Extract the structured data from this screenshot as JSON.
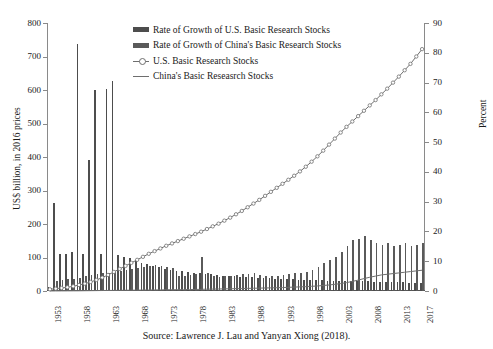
{
  "figure": {
    "source_note": "Source: Lawrence J. Lau and Yanyan Xiong (2018)."
  },
  "legend": {
    "items": [
      {
        "label": "Rate of Growth of U.S. Basic Research Stocks",
        "marker": "bar-swatch",
        "color": "#4d4d4d"
      },
      {
        "label": "Rate of Growth of China's Basic Research Stocks",
        "marker": "bar-swatch",
        "color": "#5a5a5a"
      },
      {
        "label": "U.S. Basic Research Stocks",
        "marker": "line-open-circle",
        "color": "#6e6e6e"
      },
      {
        "label": "China's Basic Reseasrch Stocks",
        "marker": "line-plain",
        "color": "#6e6e6e"
      }
    ]
  },
  "chart_data": {
    "type": "bar",
    "title": "",
    "xlabel": "",
    "ylabel": "US$ billion, in 2016 prices",
    "y2label": "Percent",
    "ylim": [
      0,
      800
    ],
    "y2lim": [
      0,
      90
    ],
    "yticks": [
      0,
      100,
      200,
      300,
      400,
      500,
      600,
      700,
      800
    ],
    "y2ticks": [
      0,
      10,
      20,
      30,
      40,
      50,
      60,
      70,
      80,
      90
    ],
    "grid": false,
    "legend_position": "upper-center",
    "x": [
      1953,
      1954,
      1955,
      1956,
      1957,
      1958,
      1959,
      1960,
      1961,
      1962,
      1963,
      1964,
      1965,
      1966,
      1967,
      1968,
      1969,
      1970,
      1971,
      1972,
      1973,
      1974,
      1975,
      1976,
      1977,
      1978,
      1979,
      1980,
      1981,
      1982,
      1983,
      1984,
      1985,
      1986,
      1987,
      1988,
      1989,
      1990,
      1991,
      1992,
      1993,
      1994,
      1995,
      1996,
      1997,
      1998,
      1999,
      2000,
      2001,
      2002,
      2003,
      2004,
      2005,
      2006,
      2007,
      2008,
      2009,
      2010,
      2011,
      2012,
      2013,
      2014,
      2015,
      2016,
      2017
    ],
    "xtick_labels": [
      1953,
      1958,
      1963,
      1968,
      1973,
      1978,
      1983,
      1988,
      1993,
      1998,
      2003,
      2008,
      2013,
      2017
    ],
    "series": [
      {
        "name": "Rate of Growth of U.S. Basic Research Stocks",
        "axis": "right",
        "kind": "bar",
        "unit": "percent",
        "values": [
          1.5,
          29.5,
          12.5,
          12.5,
          13.0,
          83.0,
          12.5,
          44.0,
          67.5,
          12.5,
          68.0,
          70.5,
          12.0,
          11.5,
          11.0,
          10.5,
          9.5,
          9.0,
          8.5,
          8.0,
          7.5,
          7.0,
          6.8,
          6.6,
          6.4,
          6.2,
          6.0,
          5.8,
          5.6,
          5.4,
          5.2,
          5.0,
          4.9,
          4.8,
          4.7,
          4.6,
          4.5,
          4.4,
          4.3,
          4.2,
          4.1,
          4.0,
          3.9,
          3.8,
          3.8,
          3.7,
          3.6,
          3.6,
          3.5,
          3.5,
          3.4,
          3.4,
          3.3,
          3.3,
          3.2,
          3.2,
          3.1,
          3.1,
          3.0,
          3.0,
          2.9,
          2.9,
          2.8,
          2.8,
          2.7
        ]
      },
      {
        "name": "Rate of Growth of China's Basic Research Stocks",
        "axis": "right",
        "kind": "bar",
        "unit": "percent",
        "values": [
          1.0,
          3.5,
          3.8,
          4.0,
          4.2,
          4.5,
          5.0,
          5.5,
          5.8,
          6.0,
          6.2,
          6.5,
          6.8,
          7.2,
          7.5,
          7.8,
          8.2,
          8.4,
          8.6,
          8.3,
          8.0,
          7.6,
          5.0,
          5.2,
          5.4,
          5.6,
          11.5,
          6.0,
          5.0,
          4.8,
          5.0,
          5.2,
          5.4,
          5.6,
          5.8,
          6.0,
          5.5,
          5.2,
          5.0,
          5.2,
          5.5,
          5.8,
          6.0,
          6.2,
          6.5,
          7.0,
          8.0,
          9.5,
          10.5,
          11.5,
          13.0,
          15.0,
          17.0,
          17.5,
          18.5,
          17.0,
          16.0,
          15.5,
          16.0,
          15.0,
          15.5,
          16.0,
          15.0,
          15.5,
          16.0
        ]
      },
      {
        "name": "U.S. Basic Research Stocks",
        "axis": "left",
        "kind": "line-marker",
        "unit": "US$ billion",
        "values": [
          5,
          7,
          9,
          11,
          14,
          18,
          22,
          27,
          33,
          40,
          48,
          57,
          66,
          75,
          84,
          93,
          102,
          111,
          119,
          127,
          135,
          142,
          149,
          156,
          163,
          170,
          177,
          185,
          193,
          201,
          210,
          219,
          229,
          239,
          250,
          261,
          272,
          284,
          296,
          308,
          320,
          332,
          344,
          357,
          371,
          386,
          402,
          419,
          437,
          455,
          473,
          490,
          506,
          522,
          538,
          554,
          570,
          587,
          604,
          622,
          640,
          659,
          678,
          700,
          722
        ]
      },
      {
        "name": "China's Basic Reseasrch Stocks",
        "axis": "left",
        "kind": "line",
        "unit": "US$ billion",
        "values": [
          0.1,
          0.2,
          0.3,
          0.4,
          0.5,
          0.6,
          0.8,
          1.0,
          1.2,
          1.4,
          1.6,
          1.8,
          2.0,
          2.2,
          2.4,
          2.6,
          2.8,
          3.0,
          3.2,
          3.4,
          3.6,
          3.8,
          4.0,
          4.2,
          4.4,
          4.6,
          5.0,
          5.4,
          5.7,
          6.0,
          6.3,
          6.6,
          7.0,
          7.4,
          7.8,
          8.2,
          8.6,
          9.0,
          9.4,
          9.9,
          10.4,
          11.0,
          11.6,
          12.3,
          13.1,
          14.0,
          15.1,
          16.4,
          18.0,
          19.9,
          22.2,
          25.0,
          28.5,
          32.5,
          37.0,
          41.0,
          44.5,
          48.0,
          50.0,
          52.0,
          54.0,
          56.0,
          58.0,
          60.0,
          62.0
        ]
      }
    ]
  }
}
